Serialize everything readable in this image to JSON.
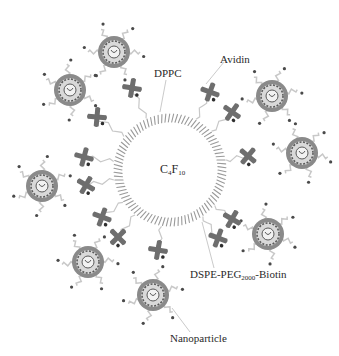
{
  "figure": {
    "type": "schematic"
  },
  "labels": {
    "core": {
      "main": "C",
      "sub1": "4",
      "mid": "F",
      "sub2": "10"
    },
    "dppc": "DPPC",
    "avidin": "Avidin",
    "dspe": {
      "pre": "DSPE-PEG",
      "sub": "2000",
      "post": "-Biotin"
    },
    "nanoparticle": "Nanoparticle"
  },
  "colors": {
    "background": "#ffffff",
    "shell_lipid": "#9a9a9a",
    "avidin": "#6e6e6e",
    "nanoparticle_ring": "#8a8a8a",
    "nanoparticle_inner": "#5a5a5a",
    "peg_tether": "#c8c8c8",
    "biotin_dot": "#4a4a4a",
    "text": "#2a2a2a"
  },
  "bubble": {
    "cx": 170,
    "cy": 170,
    "r": 48
  },
  "nanoparticles": [
    {
      "cx": 114,
      "cy": 52
    },
    {
      "cx": 70,
      "cy": 90
    },
    {
      "cx": 272,
      "cy": 96
    },
    {
      "cx": 302,
      "cy": 153
    },
    {
      "cx": 42,
      "cy": 186
    },
    {
      "cx": 88,
      "cy": 262
    },
    {
      "cx": 268,
      "cy": 234
    },
    {
      "cx": 153,
      "cy": 295
    }
  ],
  "avidins": [
    {
      "x": 132,
      "y": 88,
      "rot": 10
    },
    {
      "x": 97,
      "y": 117,
      "rot": 5
    },
    {
      "x": 210,
      "y": 92,
      "rot": 20
    },
    {
      "x": 232,
      "y": 112,
      "rot": 35
    },
    {
      "x": 248,
      "y": 156,
      "rot": 40
    },
    {
      "x": 84,
      "y": 157,
      "rot": 15
    },
    {
      "x": 86,
      "y": 185,
      "rot": 30
    },
    {
      "x": 102,
      "y": 217,
      "rot": 20
    },
    {
      "x": 118,
      "y": 237,
      "rot": 45
    },
    {
      "x": 158,
      "y": 250,
      "rot": 10
    },
    {
      "x": 232,
      "y": 219,
      "rot": 30
    },
    {
      "x": 218,
      "y": 238,
      "rot": 20
    }
  ]
}
